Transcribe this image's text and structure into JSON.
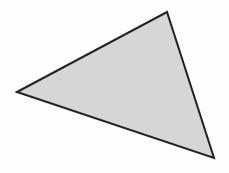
{
  "diagram": {
    "shape": "triangle",
    "vertices": [
      [
        17,
        92
      ],
      [
        167,
        12
      ],
      [
        214,
        158
      ]
    ],
    "fill": "#d6d6d6",
    "stroke": "#222222",
    "stroke_width": 2
  },
  "colors": {
    "background": "#fdfdfd"
  }
}
